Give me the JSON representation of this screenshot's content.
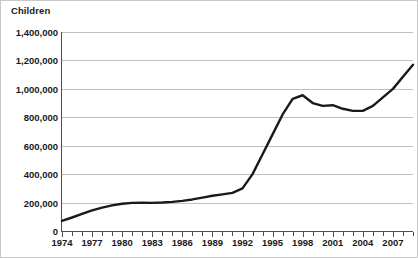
{
  "chart_data": {
    "type": "line",
    "title": "Children",
    "xlabel": "",
    "ylabel": "Children",
    "ylim": [
      0,
      1400000
    ],
    "xlim": [
      1974,
      2009
    ],
    "grid": true,
    "legend": "none",
    "line_color": "#1a1a1a",
    "gridline_color": "#bfbfbf",
    "axis_color": "#4d4d4d",
    "y_ticks": [
      0,
      200000,
      400000,
      600000,
      800000,
      1000000,
      1200000,
      1400000
    ],
    "y_tick_labels": [
      "0",
      "200,000",
      "400,000",
      "600,000",
      "800,000",
      "1,000,000",
      "1,200,000",
      "1,400,000"
    ],
    "x_ticks": [
      1974,
      1975,
      1976,
      1977,
      1978,
      1979,
      1980,
      1981,
      1982,
      1983,
      1984,
      1985,
      1986,
      1987,
      1988,
      1989,
      1990,
      1991,
      1992,
      1993,
      1994,
      1995,
      1996,
      1997,
      1998,
      1999,
      2000,
      2001,
      2002,
      2003,
      2004,
      2005,
      2006,
      2007,
      2008,
      2009
    ],
    "x_tick_labels": [
      "1974",
      "1977",
      "1980",
      "1983",
      "1986",
      "1989",
      "1992",
      "1995",
      "1998",
      "2001",
      "2004",
      "2007"
    ],
    "x_label_years": [
      1974,
      1977,
      1980,
      1983,
      1986,
      1989,
      1992,
      1995,
      1998,
      2001,
      2004,
      2007
    ],
    "x": [
      1974,
      1975,
      1976,
      1977,
      1978,
      1979,
      1980,
      1981,
      1982,
      1983,
      1984,
      1985,
      1986,
      1987,
      1988,
      1989,
      1990,
      1991,
      1992,
      1993,
      1994,
      1995,
      1996,
      1997,
      1998,
      1999,
      2000,
      2001,
      2002,
      2003,
      2004,
      2005,
      2006,
      2007,
      2008,
      2009
    ],
    "values": [
      72000,
      95000,
      120000,
      145000,
      165000,
      180000,
      192000,
      198000,
      199000,
      198000,
      200000,
      205000,
      212000,
      222000,
      235000,
      248000,
      258000,
      268000,
      300000,
      400000,
      540000,
      680000,
      820000,
      930000,
      955000,
      900000,
      880000,
      885000,
      860000,
      845000,
      845000,
      880000,
      940000,
      1000000,
      1085000,
      1170000
    ]
  }
}
